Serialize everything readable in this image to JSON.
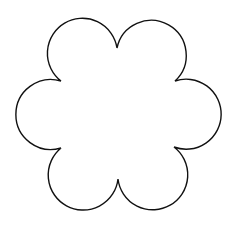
{
  "image": {
    "subject": "six-petal flower outline",
    "petal_count": 6,
    "stroke_color": "#111111",
    "fill_color": "#ffffff",
    "background_color": "#ffffff"
  },
  "watermark": {
    "text": ""
  }
}
